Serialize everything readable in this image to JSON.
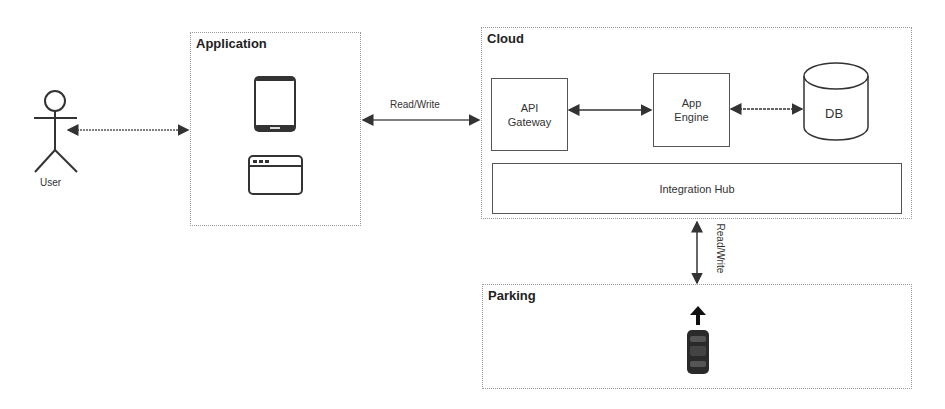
{
  "actors": {
    "user": {
      "label": "User"
    }
  },
  "groups": {
    "application": {
      "title": "Application",
      "icons": [
        "mobile-phone-icon",
        "browser-window-icon"
      ]
    },
    "cloud": {
      "title": "Cloud"
    },
    "parking": {
      "title": "Parking",
      "icons": [
        "car-icon",
        "up-arrow-icon"
      ]
    }
  },
  "nodes": {
    "api_gateway": {
      "line1": "API",
      "line2": "Gateway"
    },
    "app_engine": {
      "line1": "App",
      "line2": "Engine"
    },
    "db": {
      "label": "DB"
    },
    "integration_hub": {
      "label": "Integration Hub"
    }
  },
  "edges": {
    "app_cloud": {
      "label": "Read/Write"
    },
    "cloud_parking": {
      "label": "Read/Write"
    }
  },
  "colors": {
    "stroke": "#333333",
    "dotted_border": "#9a9a9a",
    "car": "#2a2a2a"
  }
}
